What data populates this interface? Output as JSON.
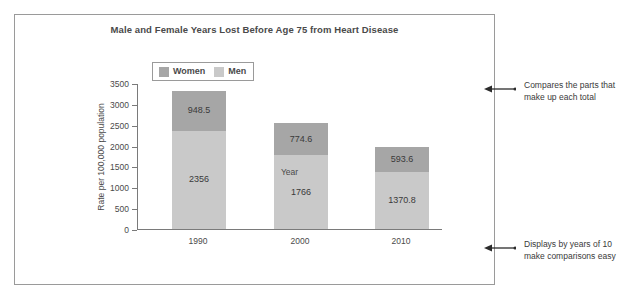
{
  "chart_data": {
    "type": "bar",
    "subtype": "stacked-bar",
    "title": "Male and Female Years Lost Before Age 75 from Heart Disease",
    "xlabel": "Year",
    "ylabel": "Rate per 100,000 population",
    "categories": [
      "1990",
      "2000",
      "2010"
    ],
    "series": [
      {
        "name": "Men",
        "values": [
          2356,
          1766,
          1370.8
        ],
        "color": "#c9c9c9"
      },
      {
        "name": "Women",
        "values": [
          948.5,
          774.6,
          593.6
        ],
        "color": "#a6a6a6"
      }
    ],
    "stack_order_bottom_to_top": [
      "Men",
      "Women"
    ],
    "data_labels": [
      {
        "category": "1990",
        "Men": "2356",
        "Women": "948.5"
      },
      {
        "category": "2000",
        "Men": "1766",
        "Women": "774.6"
      },
      {
        "category": "2010",
        "Men": "1370.8",
        "Women": "593.6"
      }
    ],
    "totals": [
      3304.5,
      2540.6,
      1964.4
    ],
    "ylim": [
      0,
      3500
    ],
    "ytick_step": 500,
    "yticks": [
      "3500",
      "3000",
      "2500",
      "2000",
      "1500",
      "1000",
      "500",
      "0"
    ],
    "grid": false,
    "legend_position": "top-left-inside",
    "legend": [
      "Women",
      "Men"
    ]
  },
  "legend": {
    "items": [
      {
        "label": "Women",
        "color": "#a6a6a6"
      },
      {
        "label": "Men",
        "color": "#c9c9c9"
      }
    ]
  },
  "annotations": [
    {
      "id": "annotation-parts-of-total",
      "text": "Compares the parts that make up each total"
    },
    {
      "id": "annotation-decade-intervals",
      "text": "Displays by years of 10 make comparisons easy"
    }
  ],
  "colors": {
    "women": "#a6a6a6",
    "men": "#c9c9c9",
    "axis": "#7a7a7a",
    "frame": "#9a9a9a",
    "text": "#3a3a3a"
  }
}
